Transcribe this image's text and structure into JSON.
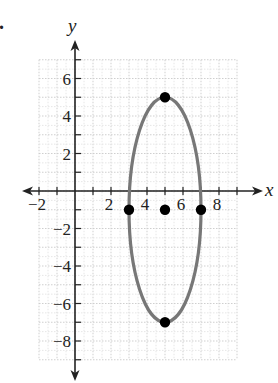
{
  "chart_data": {
    "type": "scatter",
    "title": "",
    "xlabel": "x",
    "ylabel": "y",
    "xlim": [
      -2,
      9
    ],
    "ylim": [
      -9,
      7
    ],
    "grid": true,
    "x_tick_labels": [
      {
        "value": -2,
        "label": "−2"
      },
      {
        "value": 2,
        "label": "2"
      },
      {
        "value": 4,
        "label": "4"
      },
      {
        "value": 6,
        "label": "6"
      },
      {
        "value": 8,
        "label": "8"
      }
    ],
    "y_tick_labels": [
      {
        "value": 6,
        "label": "6"
      },
      {
        "value": 4,
        "label": "4"
      },
      {
        "value": 2,
        "label": "2"
      },
      {
        "value": -2,
        "label": "−2"
      },
      {
        "value": -4,
        "label": "−4"
      },
      {
        "value": -6,
        "label": "−6"
      },
      {
        "value": -8,
        "label": "−8"
      }
    ],
    "curve": {
      "kind": "ellipse",
      "center": [
        5,
        -1
      ],
      "semi_axis_x": 2,
      "semi_axis_y": 6,
      "color": "#777777"
    },
    "points": [
      {
        "name": "top-vertex",
        "x": 5,
        "y": 5
      },
      {
        "name": "bottom-vertex",
        "x": 5,
        "y": -7
      },
      {
        "name": "left-co-vertex",
        "x": 3,
        "y": -1
      },
      {
        "name": "right-co-vertex",
        "x": 7,
        "y": -1
      },
      {
        "name": "center",
        "x": 5,
        "y": -1
      }
    ],
    "point_color": "#000000"
  },
  "problem_marker": "."
}
